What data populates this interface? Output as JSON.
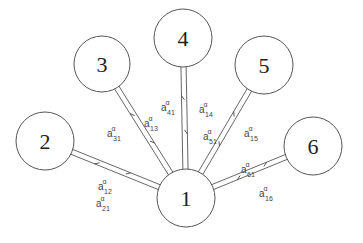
{
  "diagram": {
    "type": "star-network",
    "center_node": "1",
    "nodes": [
      {
        "id": "1",
        "label": "1",
        "cx": 186,
        "cy": 198,
        "r": 29
      },
      {
        "id": "2",
        "label": "2",
        "cx": 45,
        "cy": 141,
        "r": 29
      },
      {
        "id": "3",
        "label": "3",
        "cx": 102,
        "cy": 64,
        "r": 28
      },
      {
        "id": "4",
        "label": "4",
        "cx": 183,
        "cy": 38,
        "r": 29
      },
      {
        "id": "5",
        "label": "5",
        "cx": 264,
        "cy": 65,
        "r": 29
      },
      {
        "id": "6",
        "label": "6",
        "cx": 313,
        "cy": 146,
        "r": 29
      }
    ],
    "edges": [
      {
        "from": "1",
        "to": "2",
        "labels": [
          {
            "base": "a",
            "sup": "α",
            "sub": "12",
            "x": 98,
            "y": 190
          },
          {
            "base": "a",
            "sup": "α",
            "sub": "21",
            "x": 96,
            "y": 207
          }
        ]
      },
      {
        "from": "1",
        "to": "3",
        "labels": [
          {
            "base": "a",
            "sup": "α",
            "sub": "31",
            "x": 107,
            "y": 137
          },
          {
            "base": "a",
            "sup": "α",
            "sub": "13",
            "x": 144,
            "y": 127
          }
        ]
      },
      {
        "from": "1",
        "to": "4",
        "labels": [
          {
            "base": "a",
            "sup": "α",
            "sub": "41",
            "x": 161,
            "y": 111
          },
          {
            "base": "a",
            "sup": "α",
            "sub": "14",
            "x": 199,
            "y": 113
          }
        ]
      },
      {
        "from": "1",
        "to": "5",
        "labels": [
          {
            "base": "a",
            "sup": "α",
            "sub": "51",
            "x": 203,
            "y": 140
          },
          {
            "base": "a",
            "sup": "α",
            "sub": "15",
            "x": 244,
            "y": 137
          }
        ]
      },
      {
        "from": "1",
        "to": "6",
        "labels": [
          {
            "base": "a",
            "sup": "α",
            "sub": "61",
            "x": 241,
            "y": 173
          },
          {
            "base": "a",
            "sup": "α",
            "sub": "16",
            "x": 259,
            "y": 197
          }
        ]
      }
    ]
  }
}
